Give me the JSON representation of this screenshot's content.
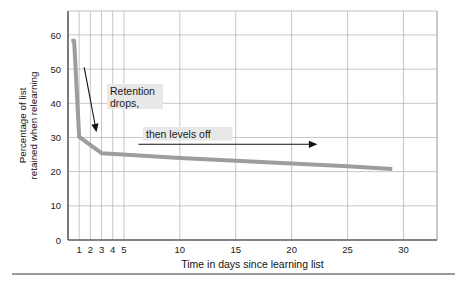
{
  "figure": {
    "background": "#ffffff",
    "rule_color": "#9a9a9a"
  },
  "chart_data": {
    "type": "line",
    "title": "",
    "subtitle": "",
    "xlabel": "Time in days since learning list",
    "ylabel": "Percentage of list retained when relearning",
    "ylabel_lines": [
      "Percentage of list",
      "retained when relearning"
    ],
    "xlim": [
      0,
      33
    ],
    "ylim": [
      0,
      67
    ],
    "xticks": [
      1,
      2,
      3,
      4,
      5,
      10,
      15,
      20,
      25,
      30
    ],
    "xticklabels": [
      "1",
      "2",
      "3",
      "4",
      "5",
      "10",
      "15",
      "20",
      "25",
      "30"
    ],
    "yticks": [
      0,
      10,
      20,
      30,
      40,
      50,
      60
    ],
    "yticklabels": [
      "0",
      "10",
      "20",
      "30",
      "40",
      "50",
      "60"
    ],
    "grid": true,
    "grid_color": "#b9b9b9",
    "axis_color": "#6e6e6e",
    "legend": null,
    "series": [
      {
        "name": "Retention curve",
        "color": "#9d9d9d",
        "linewidth": 4,
        "x": [
          0.3,
          0.55,
          1.0,
          3.0,
          6.0,
          10.0,
          15.0,
          20.0,
          25.0,
          29.0
        ],
        "y": [
          58.3,
          58.3,
          30.2,
          25.4,
          24.8,
          24.0,
          23.2,
          22.4,
          21.6,
          20.8
        ]
      }
    ],
    "annotations": [
      {
        "name": "retention-drops",
        "text": "Retention\ndrops,",
        "lines": [
          "Retention",
          "drops,"
        ],
        "color": "#1a1a1a",
        "background": "#e8e8e8",
        "arrow": {
          "from": [
            1.45,
            50.5
          ],
          "to": [
            2.55,
            31.5
          ],
          "color": "#111111"
        }
      },
      {
        "name": "then-levels-off",
        "text": "then levels off",
        "lines": [
          "then levels off"
        ],
        "color": "#1a1a1a",
        "background": "#e8e8e8",
        "arrow": {
          "from": [
            6.3,
            28.0
          ],
          "to": [
            22.3,
            28.0
          ],
          "color": "#111111"
        }
      }
    ]
  }
}
